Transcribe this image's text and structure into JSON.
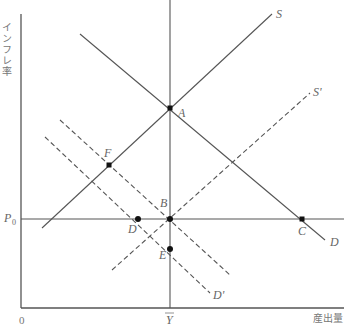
{
  "diagram": {
    "type": "economics-AD-AS",
    "y_axis_label": "インフレ率",
    "x_axis_label": "産出量",
    "origin_label": "0",
    "y_tick_label": "P",
    "y_tick_subscript": "0",
    "x_tick_label": "Y",
    "curves": {
      "S": "S",
      "S_prime": "S'",
      "D": "D",
      "D_prime": "D'"
    },
    "points": {
      "A": "A",
      "B": "B",
      "C": "C",
      "D": "D",
      "E": "E",
      "F": "F"
    }
  }
}
